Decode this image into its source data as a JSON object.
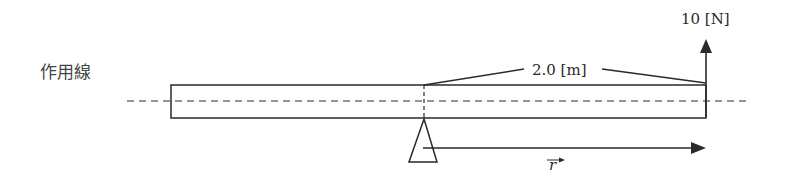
{
  "diagram": {
    "line_of_action_label": "作用線",
    "distance_label": "2.0 [m]",
    "force_label": "10 [N]",
    "position_vector_label": "r",
    "colors": {
      "stroke": "#2a2a2a",
      "background": "#ffffff"
    }
  }
}
